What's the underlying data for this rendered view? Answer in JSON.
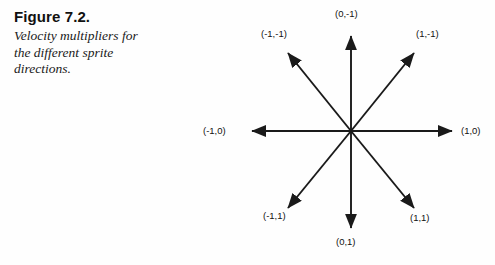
{
  "figure": {
    "title": "Figure 7.2.",
    "description_lines": [
      "Velocity multipliers for",
      "the different sprite",
      "directions."
    ],
    "description": "Velocity multipliers for the different sprite directions."
  },
  "colors": {
    "background": "#fefefe",
    "ink": "#111111",
    "arrow": "#1a1a1a"
  },
  "diagram": {
    "type": "eight-direction-vector-star",
    "center_label": "",
    "arrows": [
      {
        "id": "up",
        "label": "(0,-1)",
        "dx": 0,
        "dy": -1
      },
      {
        "id": "up-right",
        "label": "(1,-1)",
        "dx": 1,
        "dy": -1
      },
      {
        "id": "right",
        "label": "(1,0)",
        "dx": 1,
        "dy": 0
      },
      {
        "id": "down-right",
        "label": "(1,1)",
        "dx": 1,
        "dy": 1
      },
      {
        "id": "down",
        "label": "(0,1)",
        "dx": 0,
        "dy": 1
      },
      {
        "id": "down-left",
        "label": "(-1,1)",
        "dx": -1,
        "dy": 1
      },
      {
        "id": "left",
        "label": "(-1,0)",
        "dx": -1,
        "dy": 0
      },
      {
        "id": "up-left",
        "label": "(-1,-1)",
        "dx": -1,
        "dy": -1
      }
    ]
  },
  "labels": {
    "up": "(0,-1)",
    "up_right": "(1,-1)",
    "right": "(1,0)",
    "down_right": "(1,1)",
    "down": "(0,1)",
    "down_left": "(-1,1)",
    "left": "(-1,0)",
    "up_left": "(-1,-1)"
  }
}
